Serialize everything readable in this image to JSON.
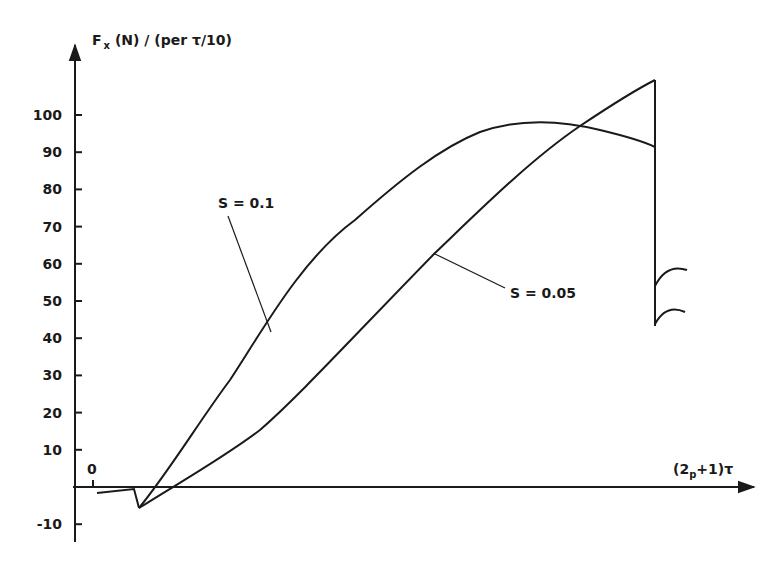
{
  "chart_data": {
    "type": "line",
    "title": "",
    "ylabel": "F_x (N) / (per τ/10)",
    "ylabel_parts": {
      "main": "F",
      "sub": "x",
      "rest": " (N) / (per τ/10)"
    },
    "xlabel": "(2p+1)τ",
    "xlabel_parts": {
      "open": "(2",
      "sub": "p",
      "rest": "+1)τ"
    },
    "ylim": [
      -15,
      115
    ],
    "y_ticks": [
      -10,
      10,
      20,
      30,
      40,
      50,
      60,
      70,
      80,
      90,
      100
    ],
    "y_tick_labels": [
      "-10",
      "10",
      "20",
      "30",
      "40",
      "50",
      "60",
      "70",
      "80",
      "90",
      "100"
    ],
    "x_origin_label": "0",
    "grid": false,
    "legend": "none (inline annotations)",
    "common_start": {
      "x": [
        0.05,
        0.55,
        0.6
      ],
      "y": [
        -2,
        -1,
        -6
      ]
    },
    "series": [
      {
        "name": "S = 0.1",
        "x": [
          0.6,
          0.85,
          1.5,
          2.3,
          3.0,
          3.9,
          4.8,
          5.6
        ],
        "y": [
          -6,
          0,
          23,
          52,
          75,
          93,
          97.5,
          91
        ],
        "end_drop_to": 53,
        "tail_arc": [
          53,
          57
        ]
      },
      {
        "name": "S = 0.05",
        "x": [
          0.6,
          1.1,
          2.0,
          3.0,
          4.0,
          5.0,
          5.6
        ],
        "y": [
          -6,
          0,
          21,
          50,
          74,
          97,
          108
        ],
        "end_drop_to": 43,
        "tail_arc": [
          43,
          48
        ]
      }
    ],
    "annotations": [
      {
        "text": "S = 0.1",
        "points_to": "S = 0.1 curve at ~y=40"
      },
      {
        "text": "S = 0.05",
        "points_to": "S = 0.05 curve at ~y=63"
      }
    ]
  }
}
